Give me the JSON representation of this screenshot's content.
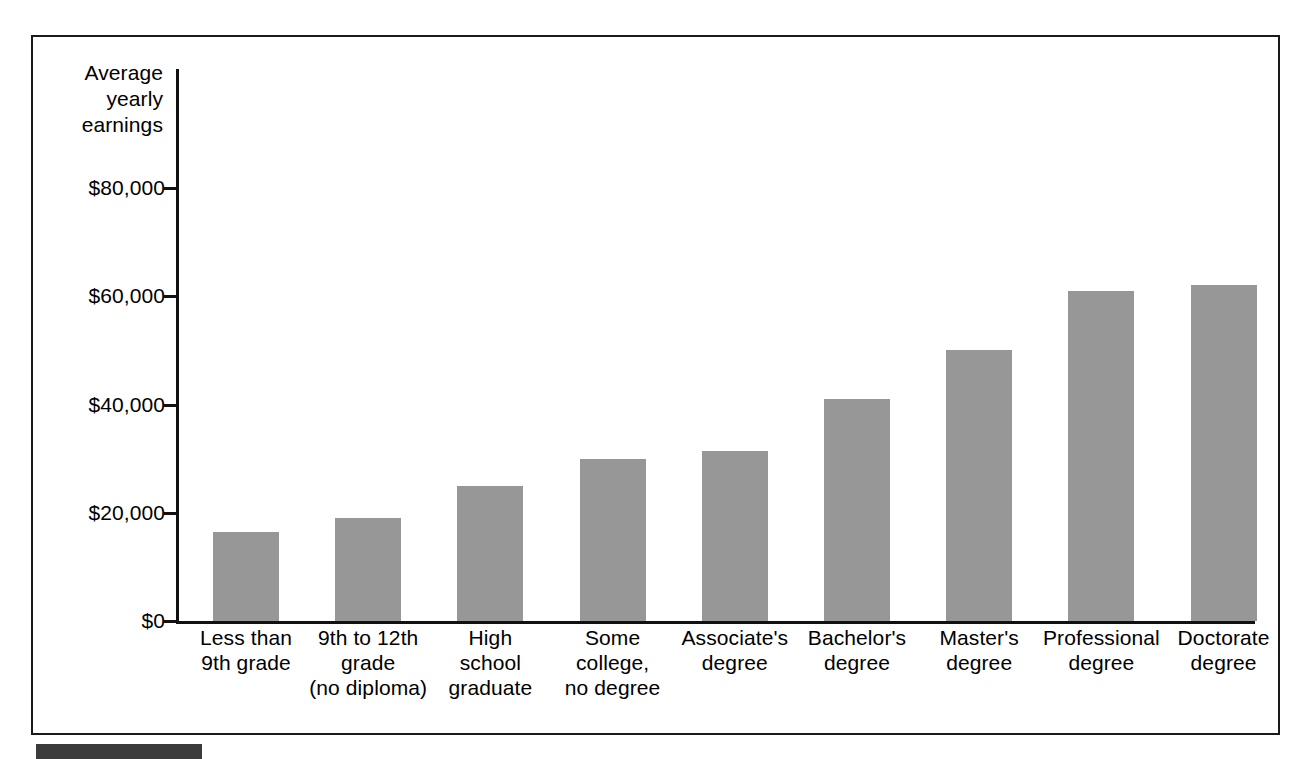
{
  "figure": {
    "y_axis_title": "Average\nyearly\nearnings",
    "frame": {
      "border_color": "#1a1a1a"
    },
    "bar_color": "#979797",
    "axis_color": "#111111",
    "caption_bar_color": "#3b3b3b"
  },
  "chart_data": {
    "type": "bar",
    "title": "",
    "xlabel": "",
    "ylabel": "Average yearly earnings",
    "ylim": [
      0,
      88000
    ],
    "grid": false,
    "legend": null,
    "ytick_labels": [
      "$0",
      "$20,000",
      "$40,000",
      "$60,000",
      "$80,000"
    ],
    "ytick_values": [
      0,
      20000,
      40000,
      60000,
      80000
    ],
    "categories": [
      "Less than\n9th grade",
      "9th to 12th\ngrade\n(no diploma)",
      "High\nschool\ngraduate",
      "Some\ncollege,\nno degree",
      "Associate's\ndegree",
      "Bachelor's\ndegree",
      "Master's\ndegree",
      "Professional\ndegree",
      "Doctorate\ndegree"
    ],
    "values": [
      16500,
      19000,
      25000,
      30000,
      31500,
      41000,
      50000,
      61000,
      62000
    ],
    "series": [
      {
        "name": "Average yearly earnings",
        "values": [
          16500,
          19000,
          25000,
          30000,
          31500,
          41000,
          50000,
          61000,
          62000
        ]
      }
    ]
  }
}
